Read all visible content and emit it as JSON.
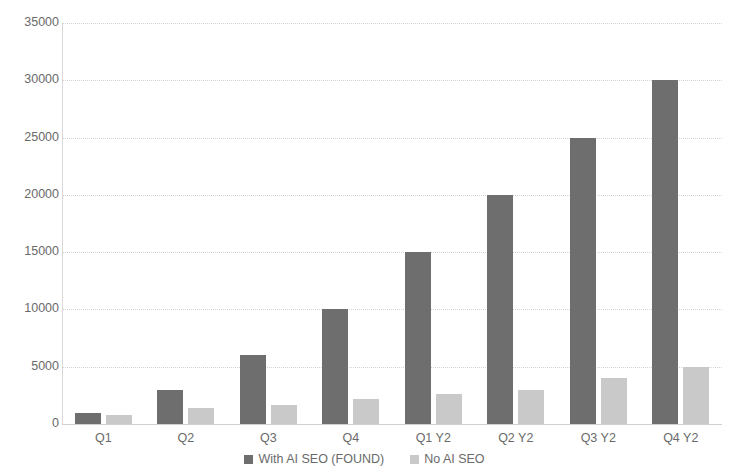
{
  "chart_data": {
    "type": "bar",
    "title": "",
    "subtitle": "",
    "xlabel": "",
    "ylabel": "",
    "categories": [
      "Q1",
      "Q2",
      "Q3",
      "Q4",
      "Q1 Y2",
      "Q2 Y2",
      "Q3 Y2",
      "Q4 Y2"
    ],
    "series": [
      {
        "name": "With AI SEO (FOUND)",
        "color": "#6e6e6e",
        "values": [
          1000,
          3000,
          6000,
          10000,
          15000,
          20000,
          25000,
          30000
        ]
      },
      {
        "name": "No AI SEO",
        "color": "#c9c9c9",
        "values": [
          800,
          1400,
          1700,
          2200,
          2600,
          3000,
          4000,
          5000
        ]
      }
    ],
    "ylim": [
      0,
      35000
    ],
    "ytick_values": [
      0,
      5000,
      10000,
      15000,
      20000,
      25000,
      30000,
      35000
    ],
    "ytick_labels": [
      "0",
      "5000",
      "10000",
      "15000",
      "20000",
      "25000",
      "30000",
      "35000"
    ],
    "grid": true,
    "grid_axis": "y",
    "grid_style": "dotted",
    "legend_position": "bottom-center",
    "background_color": "#ffffff",
    "axis_text_color": "#6a6a6a"
  }
}
